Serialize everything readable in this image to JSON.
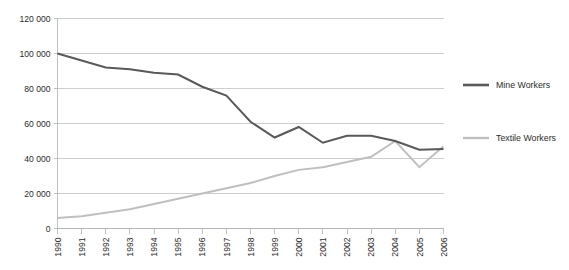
{
  "chart_data": {
    "type": "line",
    "title": "",
    "subtitle": "",
    "xlabel": "",
    "ylabel": "",
    "grid": "horizontal",
    "legend_position": "right",
    "xlim": [
      1990,
      2006
    ],
    "ylim": [
      0,
      120000
    ],
    "categories": [
      "1990",
      "1991",
      "1992",
      "1993",
      "1994",
      "1995",
      "1996",
      "1997",
      "1998",
      "1999",
      "2000",
      "2001",
      "2002",
      "2003",
      "2004",
      "2005",
      "2006"
    ],
    "ytick_labels": [
      "0",
      "20 000",
      "40 000",
      "60 000",
      "80 000",
      "100 000",
      "120 000"
    ],
    "ytick_values": [
      0,
      20000,
      40000,
      60000,
      80000,
      100000,
      120000
    ],
    "series": [
      {
        "name": "Mine Workers",
        "color": "#595959",
        "values": [
          100000,
          96000,
          92000,
          91000,
          89000,
          88000,
          81000,
          76000,
          61000,
          52000,
          58000,
          49000,
          53000,
          53000,
          50000,
          45000,
          45500
        ]
      },
      {
        "name": "Textile Workers",
        "color": "#bfbfbf",
        "values": [
          6000,
          7000,
          9000,
          11000,
          14000,
          17000,
          20000,
          23000,
          26000,
          30000,
          33500,
          35000,
          38000,
          41000,
          50000,
          35000,
          47000
        ]
      }
    ]
  },
  "legend": {
    "entries": [
      {
        "label": "Mine Workers",
        "color": "#595959",
        "swatch_name": "legend-swatch-mine-workers"
      },
      {
        "label": "Textile Workers",
        "color": "#bfbfbf",
        "swatch_name": "legend-swatch-textile-workers"
      }
    ]
  },
  "axes": {
    "y_axis_name": "value-axis",
    "x_axis_name": "year-axis"
  }
}
